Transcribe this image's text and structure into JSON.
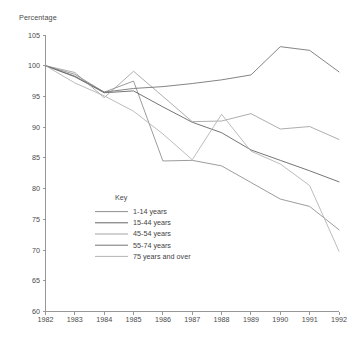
{
  "chart_data": {
    "type": "line",
    "title": "",
    "ylabel": "Percentage",
    "xlabel": "",
    "x": [
      1982,
      1983,
      1984,
      1985,
      1986,
      1987,
      1988,
      1989,
      1990,
      1991,
      1992
    ],
    "xticklabels": [
      "1982",
      "1983",
      "1984",
      "1985",
      "1986",
      "1987",
      "1988",
      "1989",
      "1990",
      "1991",
      "1992"
    ],
    "yticklabels": [
      "105",
      "100",
      "95",
      "90",
      "85",
      "80",
      "75",
      "70",
      "65",
      "60"
    ],
    "yticks": [
      105,
      100,
      95,
      90,
      85,
      80,
      75,
      70,
      65,
      60
    ],
    "ylim": [
      60,
      105
    ],
    "xlim": [
      1982,
      1992
    ],
    "grid": false,
    "legend_position": "center-left-inside",
    "legend_title": "Key",
    "series": [
      {
        "name": "1-14 years",
        "color": "#8a8a8a",
        "values": [
          100.0,
          98.6,
          95.7,
          97.5,
          84.5,
          84.6,
          83.7,
          81.0,
          78.3,
          77.1,
          73.3
        ]
      },
      {
        "name": "15-44 years",
        "color": "#5c5c5c",
        "values": [
          100.0,
          98.2,
          95.6,
          95.9,
          93.3,
          90.8,
          89.1,
          86.3,
          84.6,
          82.9,
          81.1
        ]
      },
      {
        "name": "45-54 years",
        "color": "#9e9e9e",
        "values": [
          100.0,
          98.9,
          94.8,
          99.1,
          95.0,
          90.9,
          91.0,
          92.2,
          89.7,
          90.1,
          88.0
        ]
      },
      {
        "name": "55-74 years",
        "color": "#6e6e6e",
        "values": [
          100.0,
          98.3,
          95.7,
          96.3,
          96.6,
          97.1,
          97.7,
          98.5,
          103.1,
          102.5,
          99.0
        ]
      },
      {
        "name": "75 years and over",
        "color": "#b0b0b0",
        "values": [
          100.0,
          97.2,
          95.1,
          92.6,
          88.9,
          84.7,
          92.1,
          86.1,
          84.0,
          80.5,
          69.8
        ]
      }
    ]
  }
}
